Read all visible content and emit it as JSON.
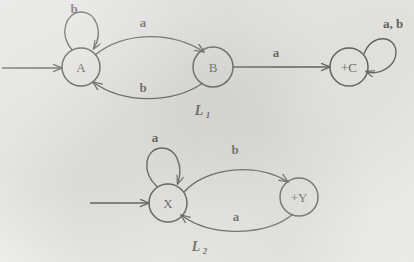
{
  "figure": {
    "kind": "finite-automata-diagram",
    "background_color": "#eeedeb",
    "ink_color": "#18170f",
    "automata": [
      {
        "name": "L1",
        "caption": "L",
        "caption_subscript": "1",
        "caption_position": {
          "x": 202,
          "y": 113
        },
        "states": [
          {
            "id": "A",
            "label": "A",
            "cx": 81,
            "cy": 67,
            "r": 19,
            "accepting": false,
            "start": true
          },
          {
            "id": "B",
            "label": "B",
            "cx": 213,
            "cy": 67,
            "r": 20,
            "accepting": false,
            "start": false
          },
          {
            "id": "C",
            "label": "+C",
            "cx": 349,
            "cy": 67,
            "r": 19,
            "accepting": true,
            "start": false
          }
        ],
        "start_arrow": {
          "x1": 2,
          "y1": 68,
          "x2": 62,
          "y2": 68
        },
        "transitions": [
          {
            "from": "A",
            "to": "A",
            "symbol": "b",
            "kind": "self-loop",
            "label_x": 74,
            "label_y": 13
          },
          {
            "from": "A",
            "to": "B",
            "symbol": "a",
            "kind": "curve-top",
            "label_x": 143,
            "label_y": 27
          },
          {
            "from": "B",
            "to": "A",
            "symbol": "b",
            "kind": "curve-bottom",
            "label_x": 143,
            "label_y": 92
          },
          {
            "from": "B",
            "to": "C",
            "symbol": "a",
            "kind": "straight",
            "label_x": 276,
            "label_y": 57
          },
          {
            "from": "C",
            "to": "C",
            "symbol": "a, b",
            "kind": "self-loop-right",
            "label_x": 392,
            "label_y": 28
          }
        ]
      },
      {
        "name": "L2",
        "caption": "L",
        "caption_subscript": "2",
        "caption_position": {
          "x": 199,
          "y": 249
        },
        "states": [
          {
            "id": "X",
            "label": "X",
            "cx": 168,
            "cy": 203,
            "r": 19,
            "accepting": false,
            "start": true
          },
          {
            "id": "Y",
            "label": "+Y",
            "cx": 299,
            "cy": 197,
            "r": 19,
            "accepting": true,
            "start": false
          }
        ],
        "start_arrow": {
          "x1": 90,
          "y1": 203,
          "x2": 149,
          "y2": 203
        },
        "transitions": [
          {
            "from": "X",
            "to": "X",
            "symbol": "a",
            "kind": "self-loop",
            "label_x": 155,
            "label_y": 142
          },
          {
            "from": "X",
            "to": "Y",
            "symbol": "b",
            "kind": "curve-top",
            "label_x": 235,
            "label_y": 154
          },
          {
            "from": "Y",
            "to": "X",
            "symbol": "a",
            "kind": "curve-bottom",
            "label_x": 236,
            "label_y": 221
          }
        ]
      }
    ]
  }
}
